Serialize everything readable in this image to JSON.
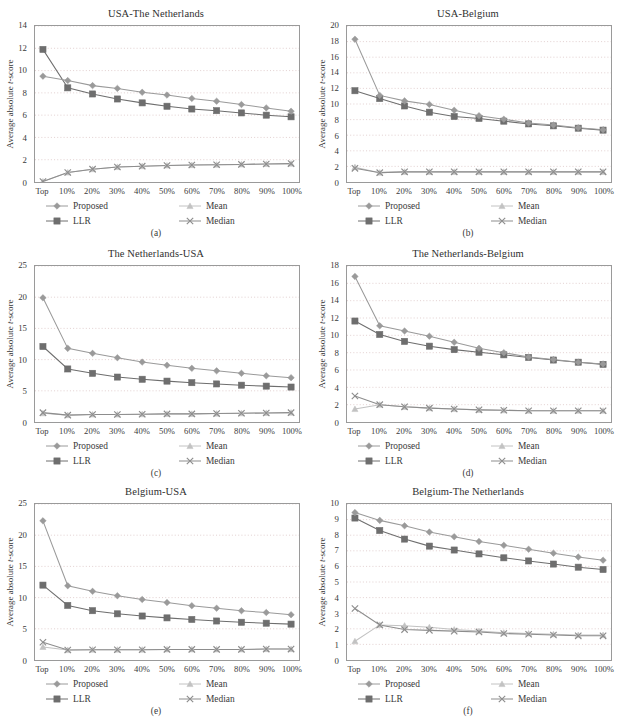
{
  "figure": {
    "ylabel_prefix": "Average absolute ",
    "ylabel_italic": "t",
    "ylabel_suffix": "-score",
    "categories": [
      "Top",
      "10%",
      "20%",
      "30%",
      "40%",
      "50%",
      "60%",
      "70%",
      "80%",
      "90%",
      "100%"
    ],
    "legend_labels": [
      "Proposed",
      "LLR",
      "Mean",
      "Median"
    ],
    "colors": {
      "proposed": "#9a9a9a",
      "llr": "#6e6e6e",
      "mean": "#c2c2c2",
      "median": "#8d8d8d",
      "axis": "#9a9a9a",
      "grid": "#c9a6a6",
      "text": "#3a3a3a"
    }
  },
  "chart_data": [
    {
      "id": "a",
      "type": "line",
      "title": "USA-The Netherlands",
      "caption": "(a)",
      "xlabel": "",
      "ylabel": "Average absolute t-score",
      "categories": [
        "Top",
        "10%",
        "20%",
        "30%",
        "40%",
        "50%",
        "60%",
        "70%",
        "80%",
        "90%",
        "100%"
      ],
      "ylim": [
        0,
        14
      ],
      "yticks": [
        0,
        2,
        4,
        6,
        8,
        10,
        12,
        14
      ],
      "grid": true,
      "legend": "bottom",
      "series": [
        {
          "name": "Proposed",
          "marker": "diamond",
          "values": [
            9.5,
            9.1,
            8.65,
            8.4,
            8.05,
            7.8,
            7.5,
            7.25,
            6.95,
            6.65,
            6.35
          ]
        },
        {
          "name": "LLR",
          "marker": "square",
          "values": [
            11.9,
            8.45,
            7.9,
            7.45,
            7.1,
            6.8,
            6.55,
            6.4,
            6.2,
            6.0,
            5.85
          ]
        },
        {
          "name": "Mean",
          "marker": "triangle",
          "values": [
            0.05,
            0.85,
            1.15,
            1.35,
            1.42,
            1.48,
            1.52,
            1.55,
            1.58,
            1.62,
            1.65
          ]
        },
        {
          "name": "Median",
          "marker": "cross",
          "values": [
            0.05,
            0.85,
            1.15,
            1.35,
            1.42,
            1.48,
            1.52,
            1.55,
            1.58,
            1.62,
            1.65
          ]
        }
      ]
    },
    {
      "id": "b",
      "type": "line",
      "title": "USA-Belgium",
      "caption": "(b)",
      "xlabel": "",
      "ylabel": "Average absolute t-score",
      "categories": [
        "Top",
        "10%",
        "20%",
        "30%",
        "40%",
        "50%",
        "60%",
        "70%",
        "80%",
        "90%",
        "100%"
      ],
      "ylim": [
        0,
        20
      ],
      "yticks": [
        0,
        2,
        4,
        6,
        8,
        10,
        12,
        14,
        16,
        18,
        20
      ],
      "grid": true,
      "legend": "bottom",
      "series": [
        {
          "name": "Proposed",
          "marker": "diamond",
          "values": [
            18.3,
            11.1,
            10.4,
            9.95,
            9.2,
            8.5,
            8.05,
            7.55,
            7.3,
            6.95,
            6.7
          ]
        },
        {
          "name": "LLR",
          "marker": "square",
          "values": [
            11.7,
            10.7,
            9.75,
            8.95,
            8.4,
            8.15,
            7.8,
            7.45,
            7.2,
            6.9,
            6.65
          ]
        },
        {
          "name": "Mean",
          "marker": "triangle",
          "values": [
            1.9,
            1.2,
            1.3,
            1.3,
            1.3,
            1.3,
            1.3,
            1.3,
            1.3,
            1.3,
            1.3
          ]
        },
        {
          "name": "Median",
          "marker": "cross",
          "values": [
            1.75,
            1.2,
            1.3,
            1.3,
            1.3,
            1.3,
            1.3,
            1.3,
            1.3,
            1.3,
            1.3
          ]
        }
      ]
    },
    {
      "id": "c",
      "type": "line",
      "title": "The Netherlands-USA",
      "caption": "(c)",
      "xlabel": "",
      "ylabel": "Average absolute t-score",
      "categories": [
        "Top",
        "10%",
        "20%",
        "30%",
        "40%",
        "50%",
        "60%",
        "70%",
        "80%",
        "90%",
        "100%"
      ],
      "ylim": [
        0,
        25
      ],
      "yticks": [
        0,
        5,
        10,
        15,
        20,
        25
      ],
      "grid": true,
      "legend": "bottom",
      "series": [
        {
          "name": "Proposed",
          "marker": "diamond",
          "values": [
            19.9,
            11.8,
            11.0,
            10.3,
            9.6,
            9.1,
            8.6,
            8.2,
            7.8,
            7.4,
            7.1
          ]
        },
        {
          "name": "LLR",
          "marker": "square",
          "values": [
            12.1,
            8.5,
            7.8,
            7.2,
            6.85,
            6.55,
            6.3,
            6.1,
            5.9,
            5.75,
            5.6
          ]
        },
        {
          "name": "Mean",
          "marker": "triangle",
          "values": [
            1.4,
            1.1,
            1.2,
            1.2,
            1.25,
            1.3,
            1.3,
            1.35,
            1.4,
            1.45,
            1.5
          ]
        },
        {
          "name": "Median",
          "marker": "cross",
          "values": [
            1.5,
            1.1,
            1.2,
            1.2,
            1.25,
            1.3,
            1.3,
            1.35,
            1.4,
            1.45,
            1.5
          ]
        }
      ]
    },
    {
      "id": "d",
      "type": "line",
      "title": "The Netherlands-Belgium",
      "caption": "(d)",
      "xlabel": "",
      "ylabel": "Average absolute t-score",
      "categories": [
        "Top",
        "10%",
        "20%",
        "30%",
        "40%",
        "50%",
        "60%",
        "70%",
        "80%",
        "90%",
        "100%"
      ],
      "ylim": [
        0,
        18
      ],
      "yticks": [
        0,
        2,
        4,
        6,
        8,
        10,
        12,
        14,
        16,
        18
      ],
      "grid": true,
      "legend": "bottom",
      "series": [
        {
          "name": "Proposed",
          "marker": "diamond",
          "values": [
            16.8,
            11.1,
            10.5,
            9.9,
            9.2,
            8.5,
            8.0,
            7.5,
            7.2,
            6.9,
            6.7
          ]
        },
        {
          "name": "LLR",
          "marker": "square",
          "values": [
            11.65,
            10.1,
            9.3,
            8.75,
            8.35,
            8.05,
            7.75,
            7.45,
            7.15,
            6.9,
            6.65
          ]
        },
        {
          "name": "Mean",
          "marker": "triangle",
          "values": [
            1.5,
            2.0,
            1.75,
            1.6,
            1.5,
            1.4,
            1.35,
            1.3,
            1.3,
            1.3,
            1.3
          ]
        },
        {
          "name": "Median",
          "marker": "cross",
          "values": [
            3.0,
            2.0,
            1.75,
            1.6,
            1.5,
            1.4,
            1.35,
            1.3,
            1.3,
            1.3,
            1.3
          ]
        }
      ]
    },
    {
      "id": "e",
      "type": "line",
      "title": "Belgium-USA",
      "caption": "(e)",
      "xlabel": "",
      "ylabel": "Average absolute t-score",
      "categories": [
        "Top",
        "10%",
        "20%",
        "30%",
        "40%",
        "50%",
        "60%",
        "70%",
        "80%",
        "90%",
        "100%"
      ],
      "ylim": [
        0,
        25
      ],
      "yticks": [
        0,
        5,
        10,
        15,
        20,
        25
      ],
      "grid": true,
      "legend": "bottom",
      "series": [
        {
          "name": "Proposed",
          "marker": "diamond",
          "values": [
            22.3,
            11.9,
            11.0,
            10.3,
            9.7,
            9.2,
            8.7,
            8.3,
            7.9,
            7.6,
            7.25
          ]
        },
        {
          "name": "LLR",
          "marker": "square",
          "values": [
            12.0,
            8.75,
            7.9,
            7.4,
            7.05,
            6.75,
            6.5,
            6.25,
            6.05,
            5.9,
            5.75
          ]
        },
        {
          "name": "Mean",
          "marker": "triangle",
          "values": [
            2.1,
            1.6,
            1.65,
            1.65,
            1.65,
            1.7,
            1.7,
            1.7,
            1.7,
            1.75,
            1.75
          ]
        },
        {
          "name": "Median",
          "marker": "cross",
          "values": [
            2.85,
            1.6,
            1.65,
            1.65,
            1.65,
            1.7,
            1.7,
            1.7,
            1.7,
            1.75,
            1.75
          ]
        }
      ]
    },
    {
      "id": "f",
      "type": "line",
      "title": "Belgium-The Netherlands",
      "caption": "(f)",
      "xlabel": "",
      "ylabel": "Average absolute t-score",
      "categories": [
        "Top",
        "10%",
        "20%",
        "30%",
        "40%",
        "50%",
        "60%",
        "70%",
        "80%",
        "90%",
        "100%"
      ],
      "ylim": [
        0,
        10
      ],
      "yticks": [
        0,
        1,
        2,
        3,
        4,
        5,
        6,
        7,
        8,
        9,
        10
      ],
      "grid": true,
      "legend": "bottom",
      "series": [
        {
          "name": "Proposed",
          "marker": "diamond",
          "values": [
            9.45,
            8.95,
            8.6,
            8.2,
            7.9,
            7.6,
            7.35,
            7.1,
            6.85,
            6.6,
            6.4
          ]
        },
        {
          "name": "LLR",
          "marker": "square",
          "values": [
            9.1,
            8.3,
            7.75,
            7.3,
            7.05,
            6.8,
            6.55,
            6.35,
            6.15,
            5.95,
            5.8
          ]
        },
        {
          "name": "Mean",
          "marker": "triangle",
          "values": [
            1.2,
            2.25,
            2.2,
            2.1,
            1.95,
            1.85,
            1.75,
            1.7,
            1.65,
            1.6,
            1.6
          ]
        },
        {
          "name": "Median",
          "marker": "cross",
          "values": [
            3.3,
            2.25,
            1.95,
            1.9,
            1.85,
            1.8,
            1.7,
            1.65,
            1.6,
            1.55,
            1.55
          ]
        }
      ]
    }
  ]
}
